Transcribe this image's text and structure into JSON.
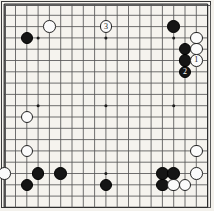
{
  "diagram": {
    "kind": "go-board-diagram",
    "board_size": 19,
    "colors": {
      "black_stone": "#151515",
      "white_stone": "#fbfbfb",
      "stone_outline": "#232323",
      "grid_line": "#565656",
      "board_background": "#f5f3ee",
      "border": "#3a3a3a"
    },
    "geometry": {
      "origin_x": 4.2,
      "origin_y": 4.0,
      "pitch": 11.3,
      "stone_diameter": 12.6,
      "hoshi_radius": 1.5
    },
    "hoshi": [
      {
        "col": 3,
        "row": 3
      },
      {
        "col": 9,
        "row": 3
      },
      {
        "col": 15,
        "row": 3
      },
      {
        "col": 3,
        "row": 9
      },
      {
        "col": 9,
        "row": 9
      },
      {
        "col": 15,
        "row": 9
      },
      {
        "col": 3,
        "row": 15
      },
      {
        "col": 9,
        "row": 15
      },
      {
        "col": 15,
        "row": 15
      }
    ],
    "stones": [
      {
        "col": 2,
        "row": 3,
        "color": "black",
        "label": ""
      },
      {
        "col": 4,
        "row": 2,
        "color": "white",
        "label": ""
      },
      {
        "col": 9,
        "row": 2,
        "color": "white",
        "label": "3"
      },
      {
        "col": 15,
        "row": 2,
        "color": "black",
        "label": ""
      },
      {
        "col": 17,
        "row": 3,
        "color": "white",
        "label": ""
      },
      {
        "col": 16,
        "row": 4,
        "color": "black",
        "label": ""
      },
      {
        "col": 17,
        "row": 4,
        "color": "white",
        "label": ""
      },
      {
        "col": 16,
        "row": 5,
        "color": "black",
        "label": ""
      },
      {
        "col": 17,
        "row": 5,
        "color": "white",
        "label": "1"
      },
      {
        "col": 16,
        "row": 6,
        "color": "black",
        "label": "2"
      },
      {
        "col": 2,
        "row": 10,
        "color": "white",
        "label": ""
      },
      {
        "col": 2,
        "row": 13,
        "color": "white",
        "label": ""
      },
      {
        "col": 17,
        "row": 13,
        "color": "white",
        "label": ""
      },
      {
        "col": 0,
        "row": 15,
        "color": "white",
        "label": ""
      },
      {
        "col": 3,
        "row": 15,
        "color": "black",
        "label": ""
      },
      {
        "col": 5,
        "row": 15,
        "color": "black",
        "label": ""
      },
      {
        "col": 14,
        "row": 15,
        "color": "black",
        "label": ""
      },
      {
        "col": 15,
        "row": 15,
        "color": "black",
        "label": ""
      },
      {
        "col": 17,
        "row": 15,
        "color": "white",
        "label": ""
      },
      {
        "col": 2,
        "row": 16,
        "color": "black",
        "label": ""
      },
      {
        "col": 9,
        "row": 16,
        "color": "black",
        "label": ""
      },
      {
        "col": 14,
        "row": 16,
        "color": "black",
        "label": ""
      },
      {
        "col": 15,
        "row": 16,
        "color": "white",
        "label": ""
      },
      {
        "col": 16,
        "row": 16,
        "color": "white",
        "label": ""
      }
    ],
    "move_labels": [
      {
        "number": "1",
        "color": "white"
      },
      {
        "number": "2",
        "color": "black"
      },
      {
        "number": "3",
        "color": "white"
      }
    ]
  }
}
